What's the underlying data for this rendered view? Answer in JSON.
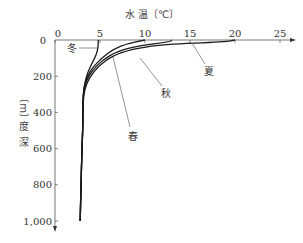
{
  "chart_data": {
    "type": "line",
    "title": "",
    "xlabel": "水 温〔℃〕",
    "ylabel": "深 度〔m〕",
    "x_axis_position": "top",
    "y_axis_inverted": true,
    "xlim": [
      0,
      25
    ],
    "ylim": [
      0,
      1000
    ],
    "x_ticks": [
      "0",
      "5",
      "10",
      "15",
      "20",
      "25"
    ],
    "y_ticks": [
      "0",
      "200",
      "400",
      "600",
      "800",
      "1,000"
    ],
    "grid": false,
    "legend": "inline labels with leader lines",
    "series": [
      {
        "name": "冬",
        "label": "冬",
        "points": [
          [
            4.8,
            0
          ],
          [
            4.8,
            40
          ],
          [
            4.6,
            80
          ],
          [
            4.2,
            120
          ],
          [
            3.6,
            180
          ],
          [
            3.2,
            260
          ],
          [
            3.1,
            350
          ],
          [
            3.1,
            450
          ],
          [
            3.0,
            600
          ],
          [
            2.9,
            800
          ],
          [
            2.8,
            1000
          ]
        ]
      },
      {
        "name": "春",
        "label": "春",
        "points": [
          [
            10.0,
            0
          ],
          [
            8.0,
            20
          ],
          [
            6.5,
            50
          ],
          [
            5.2,
            100
          ],
          [
            4.2,
            150
          ],
          [
            3.6,
            200
          ],
          [
            3.2,
            260
          ],
          [
            3.1,
            350
          ],
          [
            3.1,
            450
          ],
          [
            3.0,
            600
          ],
          [
            2.9,
            800
          ],
          [
            2.8,
            1000
          ]
        ]
      },
      {
        "name": "秋",
        "label": "秋",
        "points": [
          [
            13.0,
            0
          ],
          [
            12.8,
            10
          ],
          [
            9.5,
            30
          ],
          [
            7.0,
            60
          ],
          [
            5.3,
            110
          ],
          [
            4.2,
            165
          ],
          [
            3.5,
            220
          ],
          [
            3.2,
            280
          ],
          [
            3.1,
            350
          ],
          [
            3.1,
            450
          ],
          [
            3.0,
            600
          ],
          [
            2.9,
            800
          ],
          [
            2.8,
            1000
          ]
        ]
      },
      {
        "name": "夏",
        "label": "夏",
        "points": [
          [
            20.0,
            0
          ],
          [
            19.0,
            10
          ],
          [
            12.0,
            25
          ],
          [
            8.5,
            50
          ],
          [
            6.3,
            90
          ],
          [
            4.8,
            145
          ],
          [
            3.8,
            210
          ],
          [
            3.3,
            270
          ],
          [
            3.1,
            350
          ],
          [
            3.1,
            450
          ],
          [
            3.0,
            600
          ],
          [
            2.9,
            800
          ],
          [
            2.8,
            1000
          ]
        ]
      }
    ]
  },
  "labels": {
    "x_axis_title": "水 温〔℃〕",
    "y_axis_title_chars": [
      "深",
      "度",
      "〔m〕"
    ],
    "origin_outer": "0",
    "season_winter": "冬",
    "season_spring": "春",
    "season_autumn": "秋",
    "season_summer": "夏"
  },
  "colors": {
    "curve": "#1a1a1a",
    "axis": "#555555",
    "leader": "#666666",
    "text": "#333333"
  }
}
